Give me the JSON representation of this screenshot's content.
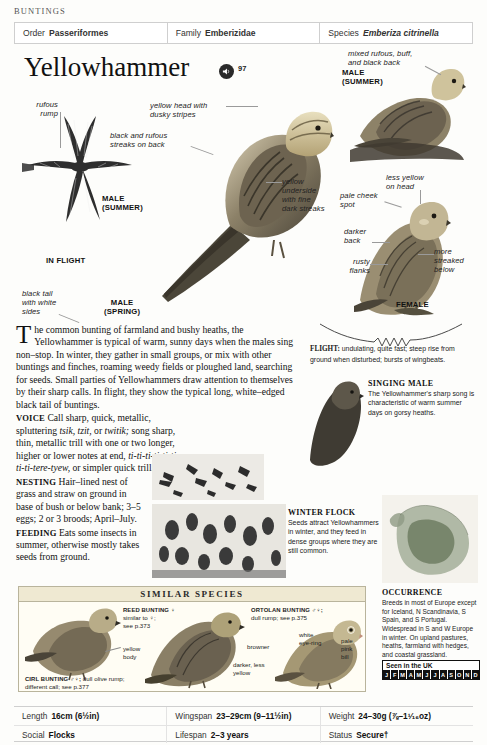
{
  "running_head": "BUNTINGS",
  "taxonomy": [
    {
      "key": "Order",
      "value": "Passeriformes",
      "italic": false
    },
    {
      "key": "Family",
      "value": "Emberizidae",
      "italic": false
    },
    {
      "key": "Species",
      "value": "Emberiza citrinella",
      "italic": true
    }
  ],
  "title": "Yellowhammer",
  "audio": {
    "icon": "speaker-icon",
    "track_number": "97"
  },
  "plate_labels": {
    "rufous_rump": "rufous\nrump",
    "in_flight": "IN FLIGHT",
    "male_summer_flight": "MALE\n(SUMMER)",
    "black_tail": "black tail\nwith white\nsides",
    "male_spring": "MALE\n(SPRING)",
    "yellow_head": "yellow head with\ndusky stripes",
    "black_rufous_streaks": "black and rufous\nstreaks on back",
    "mixed_back": "mixed rufous, buff,\nand black back",
    "male_summer_perched": "MALE\n(SUMMER)",
    "less_yellow": "less yellow\non head",
    "yellow_underside": "yellow\nunderside\nwith fine\ndark streaks",
    "pale_cheek": "pale cheek\nspot",
    "darker_back": "darker\nback",
    "rusty_flanks": "rusty\nflanks",
    "more_streaked": "more\nstreaked\nbelow",
    "female": "FEMALE"
  },
  "main_text": {
    "intro_dropcap": "T",
    "intro": "he common bunting of farmland and bushy heaths, the Yellowhammer is typical of warm, sunny days when the males sing non–stop. In winter, they gather in small groups, or mix with other buntings and finches, roaming weedy fields or ploughed land, searching for seeds. Small parties of Yellowhammers draw attention to themselves by their sharp calls. In flight, they show the typical long, white–edged black tail of buntings.",
    "voice_head": "VOICE",
    "voice_a": "Call sharp, quick, metallic, spluttering ",
    "voice_i1": "tsik, tzit,",
    "voice_b": " or ",
    "voice_i2": "twitik;",
    "voice_c": " song sharp, thin, metallic trill with one or two longer, higher or lower notes at end, ",
    "voice_i3": "ti-ti-ti-ti-ti-ti-ti-ti-tere-tyew,",
    "voice_d": " or simpler quick trill.",
    "nesting_head": "NESTING",
    "nesting": "Hair–lined nest of grass and straw on ground in base of bush or below bank; 3–5 eggs; 2 or 3 broods; April–July.",
    "feeding_head": "FEEDING",
    "feeding": "Eats some insects in summer, otherwise mostly takes seeds from ground."
  },
  "flight_caption": {
    "label": "FLIGHT:",
    "text": " undulating, quite fast; steep rise from ground when disturbed; bursts of wingbeats."
  },
  "singing_male": {
    "heading": "SINGING MALE",
    "text": "The Yellowhammer's sharp song is characteristic of warm summer days on gorsy heaths."
  },
  "winter_flock": {
    "heading": "WINTER FLOCK",
    "text": "Seeds attract Yellowhammers in winter, and they feed in dense groups where they are still common."
  },
  "occurrence": {
    "heading": "OCCURRENCE",
    "text": "Breeds in most of Europe except for Iceland, N Scandinavia, S Spain, and S Portugal. Widespread in S and W Europe in winter. On upland pastures, heaths, farmland with hedges, and coastal grassland.",
    "seen_label": "Seen in the UK",
    "months": [
      "J",
      "F",
      "M",
      "A",
      "M",
      "J",
      "J",
      "A",
      "S",
      "O",
      "N",
      "D"
    ]
  },
  "similar_species": {
    "title": "SIMILAR SPECIES",
    "entries": [
      {
        "name": "REED BUNTING ♀",
        "detail": "similar to ♀;\nsee p.373"
      },
      {
        "name": "ORTOLAN BUNTING ♂♀;",
        "detail": "dull rump; see p.375"
      },
      {
        "name": "CIRL BUNTING ♂♀;",
        "detail": " dull olive rump; different call; see p.377"
      }
    ],
    "callouts": [
      "yellow\nbody",
      "browner",
      "darker, less\nyellow",
      "white\neye-ring",
      "pale\npink\nbill"
    ]
  },
  "data_table": [
    [
      {
        "key": "Length",
        "value": "16cm (6½in)"
      },
      {
        "key": "Wingspan",
        "value": "23–29cm (9–11½in)"
      },
      {
        "key": "Weight",
        "value": "24–30g (⅞–1¹⁄₁₆oz)"
      }
    ],
    [
      {
        "key": "Social",
        "value": "Flocks"
      },
      {
        "key": "Lifespan",
        "value": "2–3 years"
      },
      {
        "key": "Status",
        "value": "Secure†"
      }
    ]
  ]
}
